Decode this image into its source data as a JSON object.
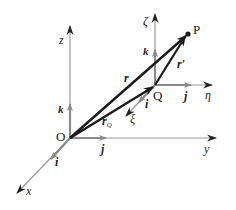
{
  "diagram": {
    "type": "vector-diagram",
    "colors": {
      "axis": "#9a9a9a",
      "unit_vector": "#8a8a8a",
      "position_vector": "#1a1a1a",
      "text": "#222222"
    },
    "points": {
      "origin": "O",
      "moving_origin": "Q",
      "target": "P"
    },
    "fixed_frame": {
      "axes": {
        "x": "x",
        "y": "y",
        "z": "z"
      },
      "unit_vectors": {
        "i": "i",
        "j": "j",
        "k": "k"
      }
    },
    "moving_frame": {
      "axes": {
        "xi": "ξ",
        "eta": "η",
        "zeta": "ζ"
      },
      "unit_vectors": {
        "i": "i",
        "j": "j",
        "k": "k"
      }
    },
    "vectors": {
      "r": "r",
      "r_prime": "r′",
      "r_Q_main": "r",
      "r_Q_sub": "Q"
    }
  }
}
